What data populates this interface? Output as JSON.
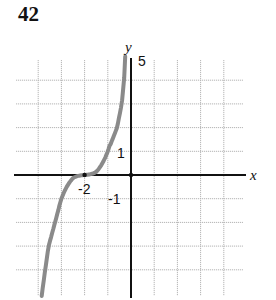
{
  "problem": {
    "number": "42"
  },
  "chart_data": {
    "type": "line",
    "title": "",
    "xlabel": "x",
    "ylabel": "y",
    "xlim": [
      -4,
      4
    ],
    "ylim": [
      -5,
      5
    ],
    "grid": true,
    "grid_step": 1,
    "tick_labels": {
      "x": [
        {
          "value": -2,
          "label": "-2"
        }
      ],
      "y": [
        {
          "value": 5,
          "label": "5"
        },
        {
          "value": 1,
          "label": "1"
        },
        {
          "value": -1,
          "label": "-1"
        }
      ]
    },
    "series": [
      {
        "name": "curve",
        "color": "#8a8a8a",
        "description": "increasing cubic-like curve with inflection at (-2, 0), approx y = (x+2)^3",
        "x": [
          -3.85,
          -3.7,
          -3.55,
          -3.0,
          -2.5,
          -2.0,
          -1.5,
          -1.0,
          -0.6,
          -0.4,
          -0.3,
          -0.25
        ],
        "y": [
          -5.1,
          -4.0,
          -3.0,
          -1.0,
          -0.15,
          0.0,
          0.15,
          1.0,
          2.0,
          3.0,
          4.0,
          5.0
        ]
      }
    ],
    "annotations": [
      {
        "type": "point",
        "x": -2,
        "y": 0
      },
      {
        "type": "point",
        "x": 0,
        "y": 0
      }
    ]
  },
  "labels": {
    "x_axis": "x",
    "y_axis": "y",
    "y_top": "5",
    "y_one": "1",
    "y_neg_one": "-1",
    "x_neg_two": "-2"
  }
}
